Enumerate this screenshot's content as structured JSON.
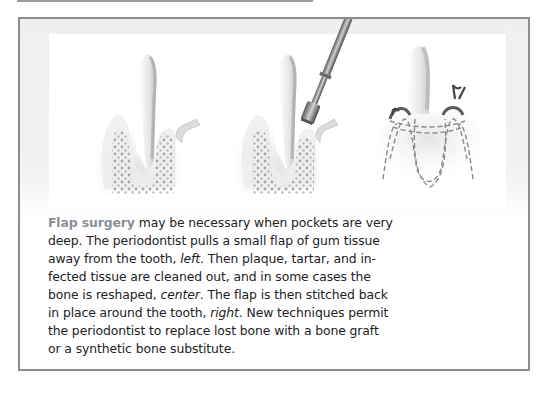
{
  "figure": {
    "illustrations": [
      {
        "name": "tooth-flap-pulled-away",
        "position": "left",
        "icon": "tooth-gum-bone-illustration"
      },
      {
        "name": "bone-reshaped-with-bur",
        "position": "center",
        "icon": "dental-bur-instrument-illustration"
      },
      {
        "name": "flap-stitched-back",
        "position": "right",
        "icon": "sutured-tooth-illustration"
      }
    ],
    "caption": {
      "lead": "Flap surgery",
      "lines": [
        {
          "before": "",
          "lead": "Flap surgery",
          "after": " may be necessary when pockets are very"
        },
        {
          "text": "deep. The periodontist pulls a small flap of gum tissue"
        },
        {
          "before": "away from the tooth, ",
          "em": "left",
          "after": ". Then plaque, tartar, and in-"
        },
        {
          "text": "fected tissue are cleaned out, and in some cases the"
        },
        {
          "before": "bone is reshaped, ",
          "em": "center",
          "after": ". The flap is then stitched back"
        },
        {
          "before": "in place around the tooth, ",
          "em": "right",
          "after": ". New techniques permit"
        },
        {
          "text": "the periodontist to replace lost bone with a bone graft"
        },
        {
          "text": "or a synthetic bone substitute."
        }
      ]
    },
    "colors": {
      "lead_text": "#8a8f96",
      "body_text": "#222222",
      "border": "#8c8c8c",
      "band": "#efefef"
    }
  }
}
